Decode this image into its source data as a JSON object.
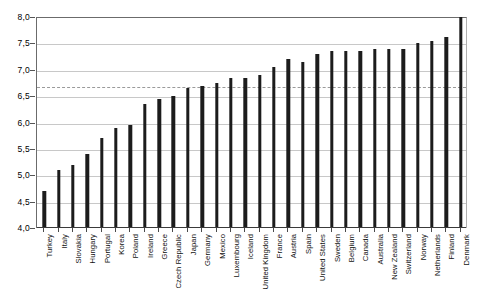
{
  "chart_data": {
    "type": "bar",
    "title": "",
    "subtitle": "",
    "xlabel": "",
    "ylabel": "",
    "ylim": [
      4.0,
      8.0
    ],
    "ytick_step": 0.5,
    "decimal_separator": ",",
    "grid": "horizontal",
    "legend": "none",
    "orientation": "vertical",
    "bar_color": "#1c1c1c",
    "grid_color": "#c8c8c8",
    "axis_color": "#6b6b6b",
    "reference_line": {
      "name": "average-reference-line",
      "value": 6.7,
      "style": "dashed",
      "color": "#9a9a9a"
    },
    "ytick_labels": [
      "8,0",
      "7,5",
      "7,0",
      "6,5",
      "6,0",
      "5,5",
      "5,0",
      "4,5",
      "4,0"
    ],
    "ytick_values": [
      8.0,
      7.5,
      7.0,
      6.5,
      6.0,
      5.5,
      5.0,
      4.5,
      4.0
    ],
    "categories": [
      "Turkey",
      "Italy",
      "Slovakia",
      "Hungary",
      "Portugal",
      "Korea",
      "Poland",
      "Ireland",
      "Greece",
      "Czech Republic",
      "Japan",
      "Germany",
      "Mexico",
      "Luxembourg",
      "Iceland",
      "United Kingdom",
      "France",
      "Austria",
      "Spain",
      "United States",
      "Sweden",
      "Belgium",
      "Canada",
      "Australia",
      "New Zealand",
      "Switzerland",
      "Norway",
      "Netherlands",
      "Finland",
      "Denmark"
    ],
    "values": [
      4.7,
      5.1,
      5.2,
      5.4,
      5.7,
      5.9,
      5.95,
      6.35,
      6.45,
      6.5,
      6.65,
      6.7,
      6.75,
      6.85,
      6.85,
      6.9,
      7.05,
      7.2,
      7.15,
      7.3,
      7.35,
      7.35,
      7.35,
      7.4,
      7.4,
      7.4,
      7.5,
      7.55,
      7.62,
      8.0
    ]
  }
}
